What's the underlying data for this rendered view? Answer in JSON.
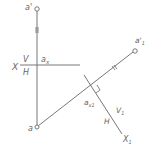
{
  "diagram": {
    "colors": {
      "line": "#777777",
      "text": "#666666",
      "background": "#ffffff"
    },
    "labels": {
      "a_prime": "a'",
      "a": "a",
      "a_x": "a",
      "a_x_sub": "x",
      "a_prime_1": "a'",
      "a_prime_1_sub": "1",
      "a_x1": "a",
      "a_x1_sub": "x1",
      "X": "X",
      "V": "V",
      "H": "H",
      "V1": "V",
      "V1_sub": "1",
      "H_new": "H",
      "X1": "X",
      "X1_sub": "1"
    },
    "points": {
      "a_prime": [
        37,
        9
      ],
      "a": [
        37,
        127
      ],
      "a_prime_1": [
        135,
        51
      ],
      "a_x": [
        37,
        65
      ],
      "a_x1": [
        93,
        88
      ]
    },
    "axes": {
      "X_axis": {
        "from": [
          20,
          65
        ],
        "to": [
          80,
          65
        ]
      },
      "X1_axis": {
        "from": [
          83,
          75
        ],
        "to": [
          123,
          135
        ]
      }
    }
  }
}
